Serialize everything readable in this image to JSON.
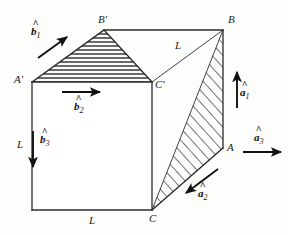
{
  "figure": {
    "background_color": "#fdfdfc",
    "line_color": "#2b2b2b",
    "hatch_color": "#3a3a3a"
  },
  "vertices": [
    {
      "id": "A-prime",
      "label": "A'",
      "x": 32,
      "y": 82
    },
    {
      "id": "B-prime",
      "label": "B'",
      "x": 104,
      "y": 30
    },
    {
      "id": "C-prime",
      "label": "C'",
      "x": 152,
      "y": 82
    },
    {
      "id": "A",
      "label": "A",
      "x": 223,
      "y": 148
    },
    {
      "id": "B",
      "label": "B",
      "x": 223,
      "y": 30
    },
    {
      "id": "C",
      "label": "C",
      "x": 152,
      "y": 210
    }
  ],
  "vertex_labels": [
    {
      "name": "vertex-label-a-prime",
      "text": "A'",
      "left": 14,
      "top": 74
    },
    {
      "name": "vertex-label-b-prime",
      "text": "B'",
      "left": 98,
      "top": 14
    },
    {
      "name": "vertex-label-c-prime",
      "text": "C'",
      "left": 155,
      "top": 79
    },
    {
      "name": "vertex-label-b",
      "text": "B",
      "left": 228,
      "top": 14
    },
    {
      "name": "vertex-label-a",
      "text": "A",
      "left": 227,
      "top": 142
    },
    {
      "name": "vertex-label-c",
      "text": "C",
      "left": 149,
      "top": 213
    }
  ],
  "length_labels": [
    {
      "name": "length-label-left-edge",
      "text": "L",
      "left": 17,
      "top": 139
    },
    {
      "name": "length-label-bottom-edge",
      "text": "L",
      "left": 89,
      "top": 215
    },
    {
      "name": "length-label-diagonal",
      "text": "L",
      "left": 175,
      "top": 40
    }
  ],
  "vectors": [
    {
      "name": "vector-b1",
      "base": "b",
      "hat": "^",
      "subscript": "1",
      "label_left": 31,
      "label_top": 26,
      "arrow": {
        "x1": 38,
        "y1": 58,
        "x2": 67,
        "y2": 37
      }
    },
    {
      "name": "vector-b2",
      "base": "b",
      "hat": "^",
      "subscript": "2",
      "label_left": 74,
      "label_top": 101,
      "arrow": {
        "x1": 62,
        "y1": 92,
        "x2": 100,
        "y2": 92
      }
    },
    {
      "name": "vector-b3",
      "base": "b",
      "hat": "^",
      "subscript": "3",
      "label_left": 40,
      "label_top": 134,
      "arrow": {
        "x1": 33,
        "y1": 131,
        "x2": 33,
        "y2": 167
      }
    },
    {
      "name": "vector-a1",
      "base": "a",
      "hat": "^",
      "subscript": "1",
      "label_left": 240,
      "label_top": 87,
      "arrow": {
        "x1": 237,
        "y1": 108,
        "x2": 237,
        "y2": 72
      }
    },
    {
      "name": "vector-a2",
      "base": "a",
      "hat": "^",
      "subscript": "2",
      "label_left": 198,
      "label_top": 188,
      "arrow": {
        "x1": 218,
        "y1": 169,
        "x2": 186,
        "y2": 193
      }
    },
    {
      "name": "vector-a3",
      "base": "a",
      "hat": "^",
      "subscript": "3",
      "label_left": 254,
      "label_top": 132,
      "arrow": {
        "x1": 243,
        "y1": 152,
        "x2": 281,
        "y2": 152
      }
    }
  ],
  "faces": {
    "front_face": {
      "name": "front-square-face",
      "points": "32,82 152,82 152,210 32,210"
    },
    "top_triangle": {
      "name": "top-hatched-triangle",
      "points": "32,82 104,30 152,82",
      "hatch": "horizontal"
    },
    "right_triangle": {
      "name": "right-hatched-triangle",
      "points": "223,30 223,148 152,210",
      "hatch": "diagonal"
    }
  },
  "edges": [
    {
      "name": "edge-aprime-cprime",
      "x1": 32,
      "y1": 82,
      "x2": 152,
      "y2": 82
    },
    {
      "name": "edge-aprime-a",
      "x1": 32,
      "y1": 82,
      "x2": 32,
      "y2": 210
    },
    {
      "name": "edge-bottom",
      "x1": 32,
      "y1": 210,
      "x2": 152,
      "y2": 210
    },
    {
      "name": "edge-cprime-c",
      "x1": 152,
      "y1": 82,
      "x2": 152,
      "y2": 210
    },
    {
      "name": "edge-bprime-b",
      "x1": 104,
      "y1": 30,
      "x2": 223,
      "y2": 30
    },
    {
      "name": "edge-b-a",
      "x1": 223,
      "y1": 30,
      "x2": 223,
      "y2": 148
    },
    {
      "name": "edge-a-c",
      "x1": 223,
      "y1": 148,
      "x2": 152,
      "y2": 210
    },
    {
      "name": "edge-cprime-b-diagonal",
      "x1": 152,
      "y1": 82,
      "x2": 223,
      "y2": 30
    },
    {
      "name": "edge-aprime-bprime",
      "x1": 32,
      "y1": 82,
      "x2": 104,
      "y2": 30
    },
    {
      "name": "edge-bprime-cprime",
      "x1": 104,
      "y1": 30,
      "x2": 152,
      "y2": 82
    },
    {
      "name": "edge-b-c-diagonal",
      "x1": 223,
      "y1": 30,
      "x2": 152,
      "y2": 210
    }
  ]
}
